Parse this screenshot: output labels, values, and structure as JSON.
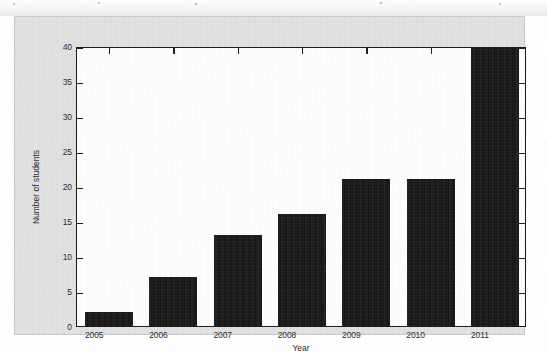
{
  "figure": {
    "background_color": "#e2e2e2",
    "plot_background_color": "#ffffff",
    "axis_color": "#1a1a1a",
    "bar_color": "#111111"
  },
  "chart_data": {
    "type": "bar",
    "title": "",
    "subtitle": "",
    "xlabel": "Year",
    "ylabel": "Number of students",
    "categories": [
      "2005",
      "2006",
      "2007",
      "2008",
      "2009",
      "2010",
      "2011"
    ],
    "values": [
      2,
      7,
      13,
      16,
      21,
      21,
      40
    ],
    "ylim": [
      0,
      40
    ],
    "ytick_labels": [
      "0",
      "5",
      "10",
      "15",
      "20",
      "25",
      "30",
      "35",
      "40"
    ],
    "ytick_values": [
      0,
      5,
      10,
      15,
      20,
      25,
      30,
      35,
      40
    ],
    "xtick_labels": [
      "2005",
      "2006",
      "2007",
      "2008",
      "2009",
      "2010",
      "2011"
    ],
    "grid": false,
    "legend": null,
    "legend_position": "none",
    "annotations": []
  }
}
